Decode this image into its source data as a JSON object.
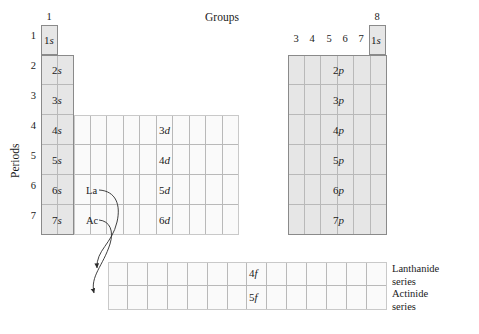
{
  "figure": {
    "groups_title": "Groups",
    "periods_title": "Periods",
    "group_numbers": {
      "s1": "1",
      "s2": "2",
      "p3": "3",
      "p4": "4",
      "p5": "5",
      "p6": "6",
      "p7": "7",
      "p8": "8"
    },
    "period_numbers": [
      "1",
      "2",
      "3",
      "4",
      "5",
      "6",
      "7"
    ],
    "s_block": {
      "labels": [
        "1s",
        "2s",
        "3s",
        "4s",
        "5s",
        "6s",
        "7s"
      ],
      "columns": 2,
      "rows": 7,
      "fill_color": "#e6e6e6"
    },
    "helium_cell": {
      "label": "1s",
      "fill_color": "#e6e6e6"
    },
    "d_block": {
      "labels": [
        "3d",
        "4d",
        "5d",
        "6d"
      ],
      "columns": 10,
      "rows": 4,
      "fill_color": "#fafafa"
    },
    "p_block": {
      "labels": [
        "2p",
        "3p",
        "4p",
        "5p",
        "6p",
        "7p"
      ],
      "columns": 6,
      "rows": 6,
      "fill_color": "#e6e6e6"
    },
    "f_block": {
      "labels": [
        "4f",
        "5f"
      ],
      "columns": 14,
      "rows": 2,
      "fill_color": "#fafafa"
    },
    "element_markers": {
      "lanthanum": "La",
      "actinium": "Ac"
    },
    "series_labels": {
      "lanthanide_line1": "Lanthanide",
      "lanthanide_line2": "series",
      "actinide_line1": "Actinide",
      "actinide_line2": "series"
    }
  }
}
